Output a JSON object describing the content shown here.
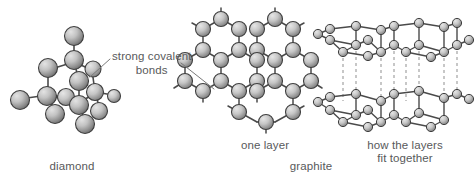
{
  "figure": {
    "type": "scientific-diagram",
    "background_color": "#ffffff",
    "atom_fill_light": "#d6d6d6",
    "atom_fill_dark": "#6e6e6e",
    "atom_outline": "#3f3f3f",
    "bond_color": "#4a4a4a",
    "dashed_line_color": "#8a8a8a",
    "text_color": "#58595b",
    "leader_line_color": "#6e6e6e"
  },
  "annotation": {
    "line1": "strong covalent",
    "line2": "bonds",
    "leader_left": {
      "x1": 110,
      "y1": 60,
      "x2": 90,
      "y2": 76
    },
    "leader_right": {
      "x1": 181,
      "y1": 63,
      "x2": 214,
      "y2": 89
    }
  },
  "captions": {
    "diamond": "diamond",
    "one_layer": "one layer",
    "graphite": "graphite",
    "how_layers_line1": "how the layers",
    "how_layers_line2": "fit together"
  },
  "structures": [
    {
      "name": "diamond",
      "description": "tetrahedral covalent lattice of carbon atoms",
      "caption": "diamond",
      "atom_count": 14
    },
    {
      "name": "graphene-layer",
      "description": "single hexagonal honeycomb sheet of carbon atoms",
      "caption": "one layer",
      "atom_count": 24
    },
    {
      "name": "graphite-stack",
      "description": "two hexagonal layers stacked with weak interlayer forces shown as dashed lines",
      "caption": "how the layers fit together",
      "layer_count": 2
    }
  ]
}
